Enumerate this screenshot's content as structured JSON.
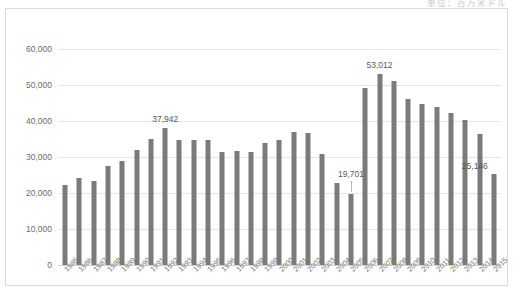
{
  "top_right_clipped_text": "単位：百万米ドル",
  "chart_data": {
    "type": "bar",
    "title": "",
    "xlabel": "",
    "ylabel": "",
    "ylim": [
      0,
      60000
    ],
    "ytick_labels": [
      "0",
      "10,000",
      "20,000",
      "30,000",
      "40,000",
      "50,000",
      "60,000"
    ],
    "yticks": [
      0,
      10000,
      20000,
      30000,
      40000,
      50000,
      60000
    ],
    "grid": true,
    "legend": "none",
    "categories": [
      "1985",
      "1986",
      "1987",
      "1988",
      "1989",
      "1990",
      "1991",
      "1992",
      "1993",
      "1994",
      "1995",
      "1996",
      "1997",
      "1998",
      "1999",
      "2000",
      "2001",
      "2002",
      "2003",
      "2004",
      "2005",
      "2006",
      "2007",
      "2008",
      "2009",
      "2010",
      "2011",
      "2012",
      "2013",
      "2014",
      "2015"
    ],
    "values": [
      22200,
      24100,
      23300,
      27400,
      28900,
      31900,
      34900,
      37942,
      34600,
      34700,
      34600,
      31500,
      31800,
      31400,
      34000,
      34600,
      37000,
      36600,
      30700,
      22900,
      19701,
      49300,
      53012,
      51000,
      46000,
      44600,
      44000,
      42200,
      40300,
      36500,
      25146
    ],
    "annotations": [
      {
        "category": "1992",
        "value": 37942,
        "label": "37,942"
      },
      {
        "category": "2005",
        "value": 19701,
        "label": "19,701"
      },
      {
        "category": "2007",
        "value": 53012,
        "label": "53,012"
      },
      {
        "category": "2015",
        "value": 25146,
        "label": "25,146"
      }
    ],
    "colors": {
      "bar": "#7b7b7b",
      "gridline": "#e6e6e6",
      "axis_text": "#6b6b6b",
      "frame_border": "#d9d9d9",
      "background": "#ffffff"
    }
  }
}
